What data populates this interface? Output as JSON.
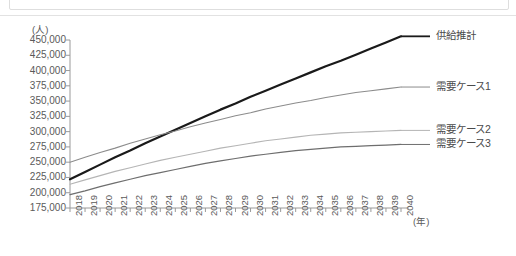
{
  "page": {
    "background_color": "#ffffff",
    "top_strip_border_color": "#dedede"
  },
  "chart_data": {
    "type": "line",
    "title": "",
    "xlabel": "(年)",
    "ylabel": "(人)",
    "x": [
      2018,
      2019,
      2020,
      2021,
      2022,
      2023,
      2024,
      2025,
      2026,
      2027,
      2028,
      2029,
      2030,
      2031,
      2032,
      2033,
      2034,
      2035,
      2036,
      2037,
      2038,
      2039,
      2040
    ],
    "xlim": [
      2018,
      2040
    ],
    "ylim": [
      175000,
      450000
    ],
    "ytick_step": 25000,
    "yticks": [
      450000,
      425000,
      400000,
      375000,
      350000,
      325000,
      300000,
      275000,
      250000,
      225000,
      200000,
      175000
    ],
    "ytick_labels": [
      "450,000",
      "425,000",
      "400,000",
      "375,000",
      "350,000",
      "325,000",
      "300,000",
      "275,000",
      "250,000",
      "225,000",
      "200,000",
      "175,000"
    ],
    "xtick_labels": [
      "2018",
      "2019",
      "2020",
      "2021",
      "2022",
      "2023",
      "2024",
      "2025",
      "2026",
      "2027",
      "2028",
      "2029",
      "2030",
      "2031",
      "2032",
      "2033",
      "2034",
      "2035",
      "2036",
      "2037",
      "2038",
      "2039",
      "2040"
    ],
    "grid": false,
    "legend_position": "right",
    "series": [
      {
        "name": "供給推計",
        "color": "#1a1a1a",
        "width": 2.2,
        "values": [
          222000,
          234000,
          246000,
          258000,
          269000,
          281000,
          292000,
          303000,
          314000,
          325000,
          336000,
          346000,
          357000,
          367000,
          377000,
          387000,
          397000,
          407000,
          416000,
          426000,
          436000,
          446000,
          456000
        ]
      },
      {
        "name": "需要ケース1",
        "color": "#8c8c8c",
        "width": 1.1,
        "values": [
          250000,
          258000,
          266000,
          273000,
          281000,
          288000,
          295000,
          301000,
          308000,
          314000,
          320000,
          326000,
          331000,
          337000,
          342000,
          347000,
          351000,
          356000,
          360000,
          364000,
          367000,
          370000,
          373000
        ]
      },
      {
        "name": "需要ケース2",
        "color": "#b5b5b5",
        "width": 1.1,
        "values": [
          214000,
          221000,
          228000,
          235000,
          241000,
          247000,
          253000,
          258000,
          263000,
          268000,
          273000,
          277000,
          281000,
          285000,
          288000,
          291000,
          294000,
          296000,
          298000,
          299000,
          300000,
          301000,
          302000
        ]
      },
      {
        "name": "需要ケース3",
        "color": "#6e6e6e",
        "width": 1.2,
        "values": [
          197000,
          203000,
          210000,
          216000,
          222000,
          228000,
          233000,
          238000,
          243000,
          248000,
          252000,
          256000,
          260000,
          263000,
          266000,
          269000,
          271000,
          273000,
          275000,
          276000,
          277000,
          278000,
          279000
        ]
      }
    ]
  },
  "legend": {
    "items": [
      {
        "label": "供給推計"
      },
      {
        "label": "需要ケース1"
      },
      {
        "label": "需要ケース2"
      },
      {
        "label": "需要ケース3"
      }
    ]
  },
  "axis": {
    "line_color": "#9a9a9a",
    "tick_color": "#9a9a9a"
  }
}
